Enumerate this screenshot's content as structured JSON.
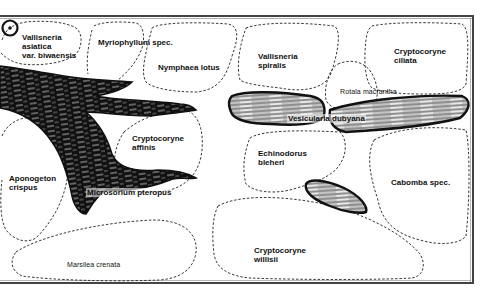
{
  "diagram": {
    "orientation_marker": "front-marker",
    "colors": {
      "ink": "#111111",
      "frame": "#555555",
      "background": "#ffffff",
      "wood_highlight": "#d8d8d8"
    },
    "plants": [
      {
        "id": "vallisneria-asiatica",
        "lines": [
          "Vallisneria",
          "asiatica",
          "var. biwaensis"
        ]
      },
      {
        "id": "myriophyllum",
        "lines": [
          "Myriophyllum spec."
        ]
      },
      {
        "id": "nymphaea-lotus",
        "lines": [
          "Nymphaea lotus"
        ]
      },
      {
        "id": "vallisneria-spiralis",
        "lines": [
          "Vallisneria",
          "spiralis"
        ]
      },
      {
        "id": "rotala-macrantha",
        "lines": [
          "Rotala macrantha"
        ]
      },
      {
        "id": "cryptocoryne-ciliata",
        "lines": [
          "Cryptocoryne",
          "ciliata"
        ]
      },
      {
        "id": "vesicularia-dubyana",
        "lines": [
          "Vesicularia dubyana"
        ]
      },
      {
        "id": "cryptocoryne-affinis",
        "lines": [
          "Cryptocoryne",
          "affinis"
        ]
      },
      {
        "id": "aponogeton-crispus",
        "lines": [
          "Aponogeton",
          "crispus"
        ]
      },
      {
        "id": "microsorium-pteropus",
        "lines": [
          "Microsorium pteropus"
        ]
      },
      {
        "id": "echinodorus-bleheri",
        "lines": [
          "Echinodorus",
          "bleheri"
        ]
      },
      {
        "id": "cabomba",
        "lines": [
          "Cabomba spec."
        ]
      },
      {
        "id": "marsilea-crenata",
        "lines": [
          "Marsilea crenata"
        ]
      },
      {
        "id": "cryptocoryne-willisii",
        "lines": [
          "Cryptocoryne",
          "willisii"
        ]
      }
    ]
  }
}
